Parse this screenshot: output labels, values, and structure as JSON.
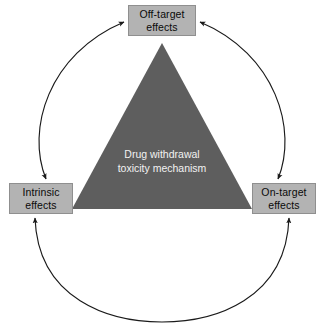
{
  "diagram": {
    "type": "triangle-cycle-diagram",
    "background_color": "#ffffff",
    "center": {
      "shape": "triangle",
      "fill_color": "#5e5e5e",
      "text_color": "#f2f2f2",
      "label_line1": "Drug withdrawal",
      "label_line2": "toxicity mechanism"
    },
    "nodes": [
      {
        "id": "off-target",
        "position": "top",
        "label_line1": "Off-target",
        "label_line2": "effects",
        "fill_color": "#b3b3b3",
        "border_color": "#8f8f8f",
        "text_color": "#0a0a0a"
      },
      {
        "id": "intrinsic",
        "position": "left",
        "label_line1": "Intrinsic",
        "label_line2": "effects",
        "fill_color": "#b3b3b3",
        "border_color": "#8f8f8f",
        "text_color": "#0a0a0a"
      },
      {
        "id": "on-target",
        "position": "right",
        "label_line1": "On-target",
        "label_line2": "effects",
        "fill_color": "#b3b3b3",
        "border_color": "#8f8f8f",
        "text_color": "#0a0a0a"
      }
    ],
    "connectors": [
      {
        "id": "left-arc",
        "from": "intrinsic",
        "to": "off-target",
        "style": "curved",
        "arrowheads": "both",
        "stroke_color": "#1a1a1a"
      },
      {
        "id": "right-arc",
        "from": "off-target",
        "to": "on-target",
        "style": "curved",
        "arrowheads": "both",
        "stroke_color": "#1a1a1a"
      },
      {
        "id": "bottom-arc",
        "from": "intrinsic",
        "to": "on-target",
        "style": "curved",
        "arrowheads": "both",
        "stroke_color": "#1a1a1a"
      }
    ]
  }
}
